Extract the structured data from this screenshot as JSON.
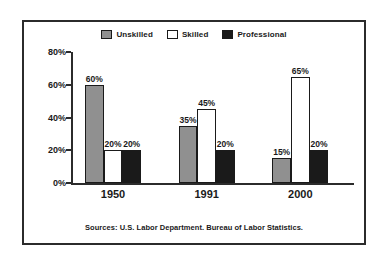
{
  "frame": {
    "border_color": "#2b2b2b",
    "background": "#ffffff"
  },
  "legend": {
    "items": [
      {
        "label": "Unskilled",
        "color": "#909090",
        "swatch_name": "legend-swatch-unskilled"
      },
      {
        "label": "Skilled",
        "color": "#ffffff",
        "swatch_name": "legend-swatch-skilled"
      },
      {
        "label": "Professional",
        "color": "#1a1a1a",
        "swatch_name": "legend-swatch-professional"
      }
    ]
  },
  "source_note": "Sources: U.S. Labor Department. Bureau of Labor Statistics.",
  "chart_data": {
    "type": "bar",
    "title": "",
    "subtitle": "",
    "xlabel": "",
    "ylabel": "",
    "categories": [
      "1950",
      "1991",
      "2000"
    ],
    "series": [
      {
        "name": "Unskilled",
        "color": "#909090",
        "values": [
          60,
          35,
          15
        ],
        "labels": [
          "60%",
          "35%",
          "15%"
        ]
      },
      {
        "name": "Skilled",
        "color": "#ffffff",
        "values": [
          20,
          45,
          65
        ],
        "labels": [
          "20%",
          "45%",
          "65%"
        ]
      },
      {
        "name": "Professional",
        "color": "#1a1a1a",
        "values": [
          20,
          20,
          20
        ],
        "labels": [
          "20%",
          "20%",
          "20%"
        ]
      }
    ],
    "ylim": [
      0,
      80
    ],
    "ytick_values": [
      0,
      20,
      40,
      60,
      80
    ],
    "ytick_labels": [
      "0%",
      "20%",
      "40%",
      "60%",
      "80%"
    ],
    "grid": false,
    "legend_position": "top-center",
    "bar_outline_color": "#1a1a1a",
    "axis_color": "#2b2b2b",
    "annotation": "Sources: U.S. Labor Department. Bureau of Labor Statistics."
  }
}
